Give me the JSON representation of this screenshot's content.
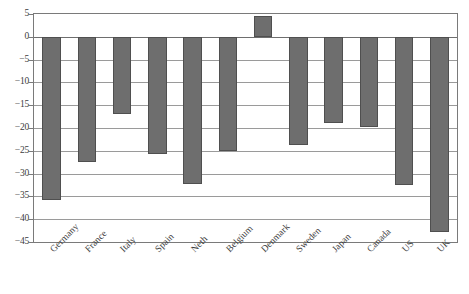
{
  "chart_data": {
    "type": "bar",
    "title": "",
    "xlabel": "",
    "ylabel": "",
    "categories": [
      "Germany",
      "France",
      "Italy",
      "Spain",
      "Neth",
      "Belgium",
      "Denmark",
      "Sweden",
      "Japan",
      "Canada",
      "US",
      "UK"
    ],
    "values": [
      -35.7,
      -27.5,
      -17.0,
      -25.8,
      -32.3,
      -25.1,
      4.5,
      -23.7,
      -19.0,
      -19.8,
      -32.5,
      -42.7
    ],
    "ylim": [
      -45,
      5
    ],
    "ytick_labels": [
      "5",
      "0",
      "−5",
      "−10",
      "−15",
      "−20",
      "−25",
      "−30",
      "−35",
      "−40",
      "−45"
    ],
    "ytick_values": [
      5,
      0,
      -5,
      -10,
      -15,
      -20,
      -25,
      -30,
      -35,
      -40,
      -45
    ],
    "grid": true,
    "legend": "none",
    "series_name": "",
    "bar_color": "#6e6e6e",
    "bar_edge_color": "#4f4f4f",
    "grid_color": "#9a9a9a",
    "frame_color": "#7a7a7a",
    "background": "#ffffff",
    "xlabel_rotation": -45
  }
}
